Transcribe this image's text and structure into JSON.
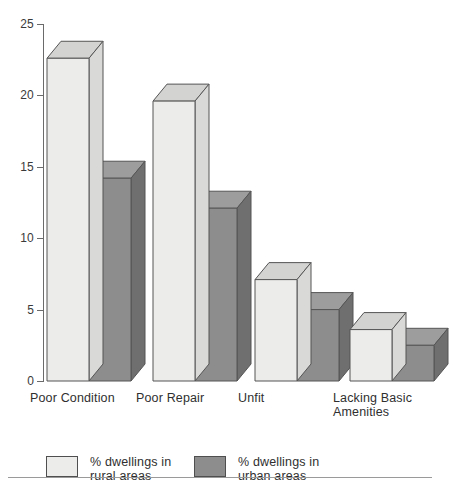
{
  "chart_data": {
    "type": "bar",
    "title": "",
    "subtitle": "",
    "xlabel": "",
    "ylabel": "",
    "ylim": [
      0,
      25
    ],
    "yticks": [
      0,
      5,
      10,
      15,
      20,
      25
    ],
    "grid": false,
    "legend_position": "bottom-left",
    "style": "3d-grouped-column",
    "categories": [
      "Poor Condition",
      "Poor Repair",
      "Unfit",
      "Lacking Basic Amenities"
    ],
    "series": [
      {
        "name": "% dwellings in rural areas",
        "color": "#ececeb",
        "values": [
          22.6,
          19.6,
          7.1,
          3.6
        ]
      },
      {
        "name": "% dwellings in urban areas",
        "color": "#8d8d8d",
        "values": [
          14.2,
          12.1,
          5.0,
          2.5
        ]
      }
    ]
  },
  "axis": {
    "y_tick_labels": [
      "25",
      "20",
      "15",
      "10",
      "5",
      "0"
    ]
  },
  "categories_display": [
    "Poor Condition",
    "Poor Repair",
    "Unfit",
    "Lacking Basic\nAmenities"
  ],
  "legend": {
    "items": [
      {
        "label": "% dwellings in\nrural areas",
        "swatch": "light"
      },
      {
        "label": "% dwellings in\nurban areas",
        "swatch": "dark"
      }
    ]
  },
  "colors": {
    "rural_front": "#ececeb",
    "rural_top": "#d3d3d2",
    "rural_side": "#d9d9d8",
    "urban_front": "#8d8d8d",
    "urban_top": "#9d9d9d",
    "urban_side": "#6f6f6f",
    "outline": "#555555",
    "axis": "#6a6a6a",
    "text": "#2f2f2f",
    "background": "#ffffff"
  }
}
